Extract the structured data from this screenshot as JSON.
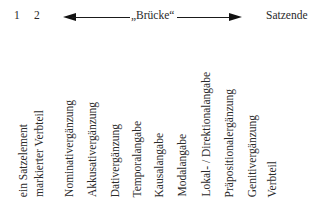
{
  "header": {
    "pos1": "1",
    "pos2": "2",
    "bridge_label": "„Brücke“",
    "end_label": "Satzende"
  },
  "labels": [
    {
      "text": "ein Satzelement",
      "x": 18
    },
    {
      "text": "markierter Verbteil",
      "x": 34
    },
    {
      "text": "Nominativergänzung",
      "x": 64
    },
    {
      "text": "Akkusativergänzung",
      "x": 87
    },
    {
      "text": "Dativergänzung",
      "x": 110
    },
    {
      "text": "Temporalangabe",
      "x": 132
    },
    {
      "text": "Kausalangabe",
      "x": 154
    },
    {
      "text": "Modalangabe",
      "x": 177
    },
    {
      "text": "Lokal- / Direktionalangabe",
      "x": 201
    },
    {
      "text": "Präpositionalergänzung",
      "x": 224
    },
    {
      "text": "Genitivergänzung",
      "x": 247
    },
    {
      "text": "Verbteil",
      "x": 267
    }
  ]
}
